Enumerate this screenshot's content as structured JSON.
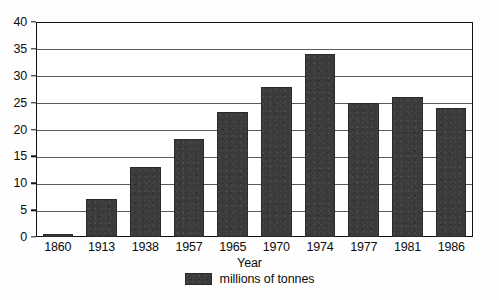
{
  "chart_data": {
    "type": "bar",
    "title": "",
    "subtitle": "",
    "xlabel": "Year",
    "ylabel": "",
    "categories": [
      "1860",
      "1913",
      "1938",
      "1957",
      "1965",
      "1970",
      "1974",
      "1977",
      "1981",
      "1986"
    ],
    "values": [
      0.4,
      7,
      13,
      18.3,
      23.2,
      28,
      34,
      25,
      26,
      24
    ],
    "series": [
      {
        "name": "millions of tonnes",
        "values": [
          0.4,
          7,
          13,
          18.3,
          23.2,
          28,
          34,
          25,
          26,
          24
        ]
      }
    ],
    "ylim": [
      0,
      40
    ],
    "ytick_labels": [
      "0",
      "5",
      "10",
      "15",
      "20",
      "25",
      "30",
      "35",
      "40"
    ],
    "ytick_values": [
      0,
      5,
      10,
      15,
      20,
      25,
      30,
      35,
      40
    ],
    "grid": "horizontal",
    "legend_position": "bottom-center",
    "legend_entries": [
      "millions of tonnes"
    ],
    "bar_color": "#3b3b3b",
    "gridline_color": "#5a5a5a",
    "frame_color": "#111111",
    "background_color": "#ffffff"
  },
  "axes": {
    "x_title": "Year"
  },
  "legend": {
    "swatch_name": "series-color-swatch",
    "label": "millions of tonnes"
  }
}
